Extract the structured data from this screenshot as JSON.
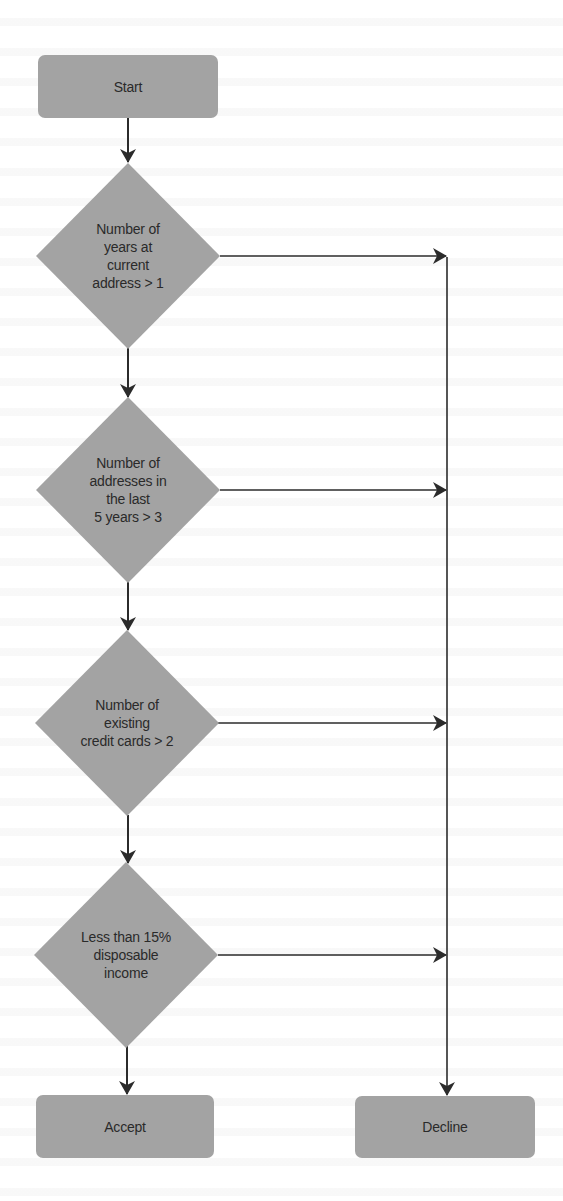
{
  "colors": {
    "shape_fill": "#a3a3a3",
    "line": "#2b2b2b",
    "text": "#2a2a2a",
    "background": "#ffffff"
  },
  "flowchart": {
    "start": {
      "label": "Start"
    },
    "decisions": [
      {
        "label": "Number of\nyears at\ncurrent\naddress > 1"
      },
      {
        "label": "Number of\naddresses in\nthe last\n5 years > 3"
      },
      {
        "label": "Number of\nexisting\ncredit cards > 2"
      },
      {
        "label": "Less than 15%\ndisposable\nincome"
      }
    ],
    "accept": {
      "label": "Accept"
    },
    "decline": {
      "label": "Decline"
    }
  }
}
